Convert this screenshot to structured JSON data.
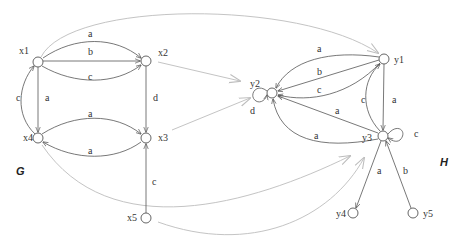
{
  "graphs": {
    "G": {
      "label": "G",
      "nodes": [
        {
          "id": "x1",
          "label": "x1",
          "x": 38,
          "y": 62
        },
        {
          "id": "x2",
          "label": "x2",
          "x": 146,
          "y": 61
        },
        {
          "id": "x3",
          "label": "x3",
          "x": 146,
          "y": 138
        },
        {
          "id": "x4",
          "label": "x4",
          "x": 38,
          "y": 138
        },
        {
          "id": "x5",
          "label": "x5",
          "x": 146,
          "y": 218
        }
      ],
      "edges": [
        {
          "from": "x1",
          "to": "x2",
          "label": "a"
        },
        {
          "from": "x1",
          "to": "x2",
          "label": "b"
        },
        {
          "from": "x1",
          "to": "x2",
          "label": "c"
        },
        {
          "from": "x1",
          "to": "x4",
          "label": "a"
        },
        {
          "from": "x4",
          "to": "x1",
          "label": "c"
        },
        {
          "from": "x2",
          "to": "x3",
          "label": "d"
        },
        {
          "from": "x4",
          "to": "x3",
          "label": "a"
        },
        {
          "from": "x3",
          "to": "x4",
          "label": "a"
        },
        {
          "from": "x5",
          "to": "x3",
          "label": "c"
        }
      ]
    },
    "H": {
      "label": "H",
      "nodes": [
        {
          "id": "y1",
          "label": "y1",
          "x": 384,
          "y": 59
        },
        {
          "id": "y2",
          "label": "y2",
          "x": 272,
          "y": 93
        },
        {
          "id": "y3",
          "label": "y3",
          "x": 383,
          "y": 136
        },
        {
          "id": "y4",
          "label": "y4",
          "x": 353,
          "y": 213
        },
        {
          "id": "y5",
          "label": "y5",
          "x": 413,
          "y": 213
        }
      ],
      "edges": [
        {
          "from": "y1",
          "to": "y2",
          "label": "a"
        },
        {
          "from": "y1",
          "to": "y2",
          "label": "b"
        },
        {
          "from": "y1",
          "to": "y2",
          "label": "c"
        },
        {
          "from": "y3",
          "to": "y2",
          "label": "a"
        },
        {
          "from": "y3",
          "to": "y2",
          "label": "a"
        },
        {
          "from": "y2",
          "to": "y2",
          "label": "d"
        },
        {
          "from": "y1",
          "to": "y3",
          "label": "a"
        },
        {
          "from": "y3",
          "to": "y1",
          "label": "c"
        },
        {
          "from": "y3",
          "to": "y3",
          "label": "c"
        },
        {
          "from": "y3",
          "to": "y4",
          "label": "a"
        },
        {
          "from": "y5",
          "to": "y3",
          "label": "b"
        }
      ]
    }
  },
  "homomorphism": [
    {
      "from": "x1",
      "to": "y1"
    },
    {
      "from": "x2",
      "to": "y2"
    },
    {
      "from": "x3",
      "to": "y2"
    },
    {
      "from": "x4",
      "to": "y3"
    },
    {
      "from": "x5",
      "to": "y3"
    }
  ],
  "edge_labels": {
    "x1x2_a": "a",
    "x1x2_b": "b",
    "x1x2_c": "c",
    "x1x4_a": "a",
    "x4x1_c": "c",
    "x2x3_d": "d",
    "x4x3_a": "a",
    "x3x4_a": "a",
    "x5x3_c": "c",
    "y1y2_a": "a",
    "y1y2_b": "b",
    "y1y2_c": "c",
    "y3y2_a1": "a",
    "y3y2_a2": "a",
    "y2loop_d": "d",
    "y1y3_a": "a",
    "y3y1_c": "c",
    "y3loop_c": "c",
    "y3y4_a": "a",
    "y5y3_b": "b"
  }
}
